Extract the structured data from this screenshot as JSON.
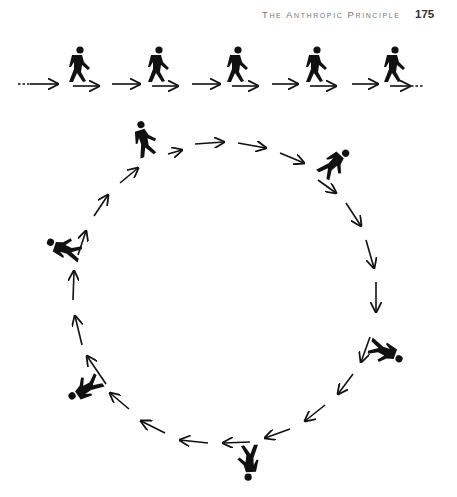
{
  "header": {
    "running_title": "The Anthropic Principle",
    "page_number": "175"
  },
  "figure": {
    "top_row": {
      "description": "five walking figures moving left to right along a dashed line of arrows",
      "figure_count": 5,
      "icon": "walking-person-icon",
      "direction": "right"
    },
    "circle": {
      "description": "seven figures walking clockwise around a circle of arrows, rotating with their position",
      "figure_count": 7,
      "icon": "walking-person-icon",
      "direction": "clockwise"
    },
    "colors": {
      "ink": "#111111",
      "paper": "#ffffff",
      "header_text": "#777777"
    }
  }
}
